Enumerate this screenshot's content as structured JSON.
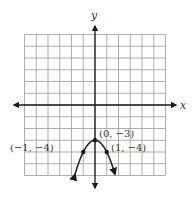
{
  "chart_data": {
    "type": "line",
    "title": "",
    "xlabel": "x",
    "ylabel": "y",
    "xlim": [
      -6,
      6
    ],
    "ylim": [
      -6,
      6
    ],
    "grid": true,
    "grid_step": 1,
    "function": "y = -x^2 - 3",
    "series": [
      {
        "name": "parabola",
        "x": [
          -1.7,
          -1,
          -0.5,
          0,
          0.5,
          1,
          1.7
        ],
        "y": [
          -5.89,
          -4,
          -3.25,
          -3,
          -3.25,
          -4,
          -5.89
        ],
        "arrows_at_ends": true
      }
    ],
    "points": [
      {
        "x": 0,
        "y": -3,
        "label": "(0, −3)"
      },
      {
        "x": -1,
        "y": -4,
        "label": "(−1, −4)"
      },
      {
        "x": 1,
        "y": -4,
        "label": "(1, −4)"
      }
    ]
  },
  "labels": {
    "x_axis": "x",
    "y_axis": "y",
    "vertex": "(0, −3)",
    "left_point": "(−1, −4)",
    "right_point": "(1, −4)"
  },
  "colors": {
    "grid": "#9a9a9a",
    "axis": "#1a1a1a",
    "curve": "#2a2a2a"
  }
}
